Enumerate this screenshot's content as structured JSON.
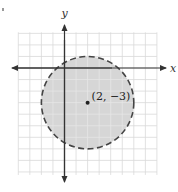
{
  "diagram": {
    "type": "coordinate-plane-inequality",
    "axes": {
      "x_label": "x",
      "y_label": "y"
    },
    "grid": {
      "x_min": -4,
      "x_max": 8,
      "y_min": -9,
      "y_max": 3,
      "step": 1
    },
    "circle": {
      "center": [
        2,
        -3
      ],
      "radius": 4,
      "boundary": "dashed",
      "shaded": "inside"
    },
    "center_point": {
      "label": "(2, −3)"
    },
    "colors": {
      "grid": "#d9d9d9",
      "fill": "#d6d6d6",
      "boundary": "#444444",
      "axis": "#333333",
      "point": "#222222"
    }
  }
}
